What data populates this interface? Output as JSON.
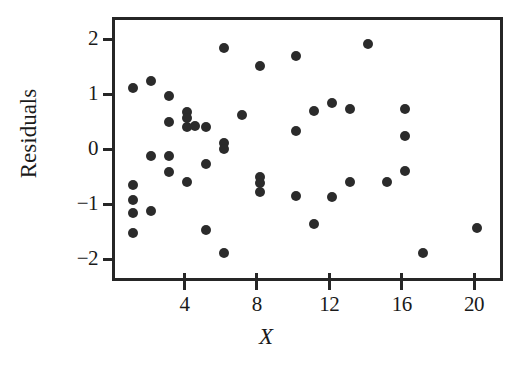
{
  "chart_data": {
    "type": "scatter",
    "title": "",
    "xlabel": "X",
    "ylabel": "Residuals",
    "xlim": [
      0,
      21.6
    ],
    "ylim": [
      -2.4,
      2.4
    ],
    "grid": false,
    "legend": null,
    "marker": {
      "shape": "circle",
      "color": "#2b2b2b",
      "size_px": 10,
      "filled": true
    },
    "xticks": [
      4,
      8,
      12,
      16,
      20
    ],
    "xtick_labels": [
      "4",
      "8",
      "12",
      "16",
      "20"
    ],
    "yticks": [
      2,
      1,
      0,
      -1,
      -2
    ],
    "ytick_labels": [
      "2",
      "1",
      "0",
      "−1",
      "−2"
    ],
    "n_points": 53,
    "points": [
      {
        "x": 1.0,
        "y": 1.17
      },
      {
        "x": 1.0,
        "y": -0.6
      },
      {
        "x": 1.0,
        "y": -0.87
      },
      {
        "x": 1.0,
        "y": -1.1
      },
      {
        "x": 1.0,
        "y": -1.47
      },
      {
        "x": 2.0,
        "y": 1.3
      },
      {
        "x": 2.0,
        "y": -0.07
      },
      {
        "x": 2.0,
        "y": -1.08
      },
      {
        "x": 3.0,
        "y": 1.02
      },
      {
        "x": 3.0,
        "y": 0.55
      },
      {
        "x": 3.0,
        "y": -0.08
      },
      {
        "x": 3.0,
        "y": -0.37
      },
      {
        "x": 4.0,
        "y": 0.72
      },
      {
        "x": 4.0,
        "y": 0.62
      },
      {
        "x": 4.0,
        "y": 0.45
      },
      {
        "x": 4.0,
        "y": -0.55
      },
      {
        "x": 4.4,
        "y": 0.47
      },
      {
        "x": 5.0,
        "y": 0.45
      },
      {
        "x": 5.0,
        "y": -0.22
      },
      {
        "x": 5.0,
        "y": -1.42
      },
      {
        "x": 6.0,
        "y": 1.9
      },
      {
        "x": 6.0,
        "y": 0.17
      },
      {
        "x": 6.0,
        "y": 0.05
      },
      {
        "x": 6.0,
        "y": -1.83
      },
      {
        "x": 7.0,
        "y": 0.67
      },
      {
        "x": 8.0,
        "y": 1.57
      },
      {
        "x": 8.0,
        "y": -0.45
      },
      {
        "x": 8.0,
        "y": -0.57
      },
      {
        "x": 8.0,
        "y": -0.72
      },
      {
        "x": 10.0,
        "y": 1.75
      },
      {
        "x": 10.0,
        "y": 0.38
      },
      {
        "x": 10.0,
        "y": -0.8
      },
      {
        "x": 11.0,
        "y": 0.75
      },
      {
        "x": 11.0,
        "y": -1.3
      },
      {
        "x": 12.0,
        "y": 0.9
      },
      {
        "x": 12.0,
        "y": -0.82
      },
      {
        "x": 13.0,
        "y": 0.78
      },
      {
        "x": 13.0,
        "y": -0.55
      },
      {
        "x": 14.0,
        "y": 1.97
      },
      {
        "x": 15.0,
        "y": -0.55
      },
      {
        "x": 16.0,
        "y": 0.78
      },
      {
        "x": 16.0,
        "y": 0.3
      },
      {
        "x": 16.0,
        "y": -0.35
      },
      {
        "x": 17.0,
        "y": -1.83
      },
      {
        "x": 20.0,
        "y": -1.38
      }
    ]
  },
  "axis": {
    "y_title": "Residuals",
    "x_title": "X"
  }
}
